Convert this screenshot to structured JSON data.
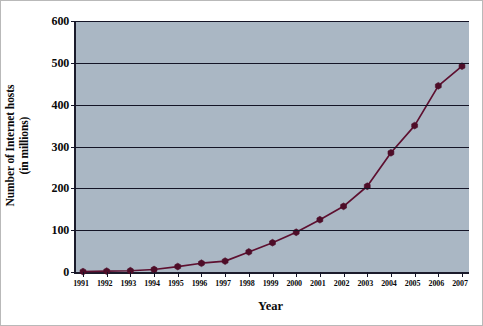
{
  "chart_data": {
    "type": "line",
    "title": "",
    "xlabel": "Year",
    "ylabel_line1": "Number of Internet hosts",
    "ylabel_line2": "(in millions)",
    "categories": [
      "1991",
      "1992",
      "1993",
      "1994",
      "1995",
      "1996",
      "1997",
      "1998",
      "1999",
      "2000",
      "2001",
      "2002",
      "2003",
      "2004",
      "2005",
      "2006",
      "2007"
    ],
    "values": [
      1,
      2,
      3,
      6,
      13,
      21,
      26,
      48,
      70,
      95,
      125,
      157,
      205,
      285,
      350,
      445,
      492
    ],
    "series": [
      {
        "name": "Internet hosts",
        "values": [
          1,
          2,
          3,
          6,
          13,
          21,
          26,
          48,
          70,
          95,
          125,
          157,
          205,
          285,
          350,
          445,
          492
        ]
      }
    ],
    "xlim": [
      1991,
      2007
    ],
    "ylim": [
      0,
      600
    ],
    "yticks": [
      0,
      100,
      200,
      300,
      400,
      500,
      600
    ],
    "ytick_labels": [
      "0",
      "100",
      "200",
      "300",
      "400",
      "500",
      "600"
    ],
    "grid": "horizontal",
    "legend": "none",
    "marker": "hexagon",
    "colors": {
      "plot_background": "#aab7c4",
      "gridline": "#141426",
      "axis": "#1b1b2b",
      "series_line": "#5e1030",
      "series_marker": "#4e0d28",
      "text": "#0a0a0a",
      "figure_background": "#ffffff",
      "frame_border": "#b9b9b9"
    }
  }
}
